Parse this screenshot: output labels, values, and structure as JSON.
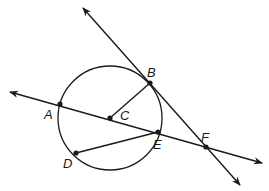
{
  "diagram": {
    "type": "geometry",
    "colors": {
      "stroke": "#1a1a1a",
      "background": "#ffffff"
    },
    "circle": {
      "center": "C",
      "cx": 110,
      "cy": 118,
      "r": 52
    },
    "points": [
      {
        "name": "A",
        "x": 60,
        "y": 104,
        "label": "A",
        "lx": 44,
        "ly": 108
      },
      {
        "name": "B",
        "x": 150,
        "y": 83,
        "label": "B",
        "lx": 147,
        "ly": 66
      },
      {
        "name": "C",
        "x": 110,
        "y": 118,
        "label": "C",
        "lx": 120,
        "ly": 109
      },
      {
        "name": "D",
        "x": 76,
        "y": 153,
        "label": "D",
        "lx": 63,
        "ly": 157
      },
      {
        "name": "E",
        "x": 158,
        "y": 132,
        "label": "E",
        "lx": 153,
        "ly": 138
      },
      {
        "name": "F",
        "x": 206,
        "y": 147,
        "label": "F",
        "lx": 201,
        "ly": 131
      }
    ],
    "lines": [
      {
        "name": "line-AF",
        "x1": 10,
        "y1": 92,
        "x2": 262,
        "y2": 163,
        "arrows": "both"
      },
      {
        "name": "line-BF",
        "x1": 83,
        "y1": 8,
        "x2": 240,
        "y2": 185,
        "arrows": "both"
      }
    ],
    "segments": [
      {
        "name": "segment-CB",
        "from": "C",
        "to": "B"
      },
      {
        "name": "segment-DE",
        "from": "D",
        "to": "E"
      }
    ]
  }
}
